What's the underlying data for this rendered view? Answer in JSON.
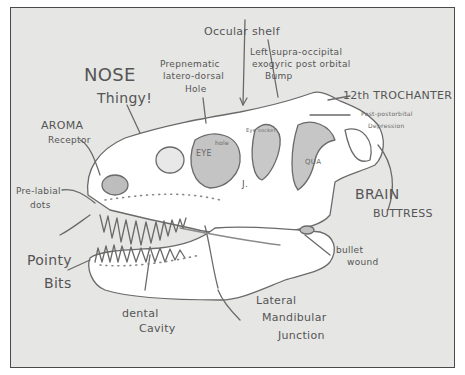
{
  "diagram": {
    "labels": {
      "occular_shelf": "Occular shelf",
      "left_supra_line1": "Left supra-occipital",
      "left_supra_line2": "exogyric post orbital",
      "left_supra_line3": "Bump",
      "prepnematic_line1": "Prepnematic",
      "prepnematic_line2": "latero-dorsal",
      "prepnematic_line3": "Hole",
      "nose_line1": "NOSE",
      "nose_line2": "Thingy!",
      "aroma_line1": "AROMA",
      "aroma_line2": "Receptor",
      "trochanter": "12th TROCHANTER",
      "post_line1": "Post-postorbital",
      "post_line2": "Depression",
      "prelabial_line1": "Pre-labial",
      "prelabial_line2": "dots",
      "brain_line1": "BRAIN",
      "brain_line2": "BUTTRESS",
      "pointy_line1": "Pointy",
      "pointy_line2": "Bits",
      "bullet_line1": "bullet",
      "bullet_line2": "wound",
      "dental_line1": "dental",
      "dental_line2": "Cavity",
      "lateral_line1": "Lateral",
      "lateral_line2": "Mandibular",
      "lateral_line3": "Junction",
      "inner_eye": "EYE",
      "inner_eye_note": "hole",
      "inner_eye2": "Eye socket",
      "inner_j": "J.",
      "inner_qua": "QUA"
    }
  }
}
